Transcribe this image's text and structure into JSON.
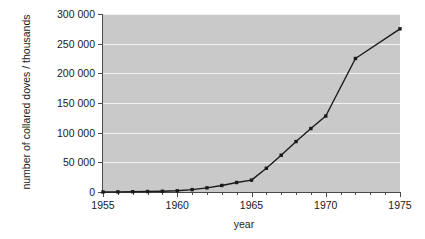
{
  "chart_data": {
    "type": "line",
    "title": "",
    "xlabel": "year",
    "ylabel": "number of collared doves / thousands",
    "xlim": [
      1955,
      1975
    ],
    "ylim": [
      0,
      300000
    ],
    "grid": "horizontal",
    "legend": "none",
    "x_tick_labels": [
      "1955",
      "1960",
      "1965",
      "1970",
      "1975"
    ],
    "x_tick_values": [
      1955,
      1960,
      1965,
      1970,
      1975
    ],
    "x_minor_tick_step": 1,
    "y_tick_labels": [
      "0",
      "50 000",
      "100 000",
      "150 000",
      "200 000",
      "250 000",
      "300 000"
    ],
    "y_tick_values": [
      0,
      50000,
      100000,
      150000,
      200000,
      250000,
      300000
    ],
    "series": [
      {
        "name": "collared doves",
        "marker": "square",
        "color": "#1a1a1a",
        "x": [
          1955,
          1956,
          1957,
          1958,
          1959,
          1960,
          1961,
          1962,
          1963,
          1964,
          1965,
          1966,
          1967,
          1968,
          1969,
          1970,
          1972,
          1975
        ],
        "values": [
          0,
          200,
          500,
          800,
          1200,
          2000,
          4000,
          7000,
          11000,
          16000,
          20000,
          40000,
          62000,
          85000,
          107000,
          128000,
          225000,
          275000
        ]
      }
    ]
  },
  "axis": {
    "x_title": "year",
    "y_title": "number of collared doves / thousands"
  },
  "colors": {
    "plot_background": "#c9c9c9",
    "gridline": "#f2f2f2",
    "axis": "#4a4a4a",
    "line": "#1a1a1a",
    "page_background": "#ffffff"
  }
}
